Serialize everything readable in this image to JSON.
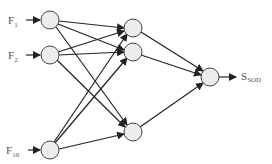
{
  "diagram": {
    "type": "neural-network",
    "colors": {
      "node_fill": "#ececec",
      "node_stroke": "#444444",
      "edge": "#222222",
      "label": "#555555"
    },
    "inputs": [
      {
        "id": "i1",
        "label": "F",
        "sub": "1",
        "x": 50,
        "y": 20
      },
      {
        "id": "i2",
        "label": "F",
        "sub": "2",
        "x": 50,
        "y": 55
      },
      {
        "id": "i3",
        "label": "F",
        "sub": "10",
        "x": 50,
        "y": 150
      }
    ],
    "hidden": [
      {
        "id": "h1",
        "x": 133,
        "y": 28
      },
      {
        "id": "h2",
        "x": 133,
        "y": 52
      },
      {
        "id": "h3",
        "x": 133,
        "y": 132
      }
    ],
    "output": {
      "id": "o1",
      "label": "S",
      "sub": "SOD",
      "x": 210,
      "y": 77
    },
    "node_radius": 9
  }
}
